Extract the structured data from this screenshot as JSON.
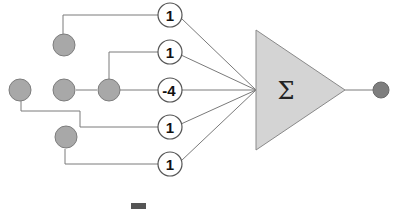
{
  "diagram": {
    "type": "weighted-sum-neuron",
    "summation_symbol": "Σ",
    "weights": [
      {
        "label": "1"
      },
      {
        "label": "1"
      },
      {
        "label": "-4"
      },
      {
        "label": "1"
      },
      {
        "label": "1"
      }
    ],
    "inputs": [
      "top",
      "left",
      "center",
      "right",
      "bottom"
    ],
    "output": "output-node",
    "colors": {
      "input_fill": "#a8a8a8",
      "weight_fill": "#ffffff",
      "sum_fill": "#d4d4d4",
      "output_fill": "#7e7e7e",
      "wire": "#7a7a7a"
    }
  }
}
